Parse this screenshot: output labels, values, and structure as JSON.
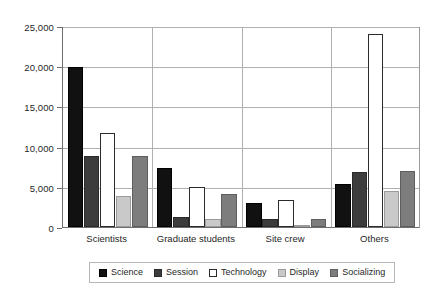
{
  "chart_data": {
    "type": "bar",
    "title": "",
    "subtitle": "",
    "xlabel": "",
    "ylabel": "",
    "ylim": [
      0,
      25000
    ],
    "ytick_values": [
      0,
      5000,
      10000,
      15000,
      20000,
      25000
    ],
    "ytick_labels": [
      "0",
      "5,000",
      "10,000",
      "15,000",
      "20,000",
      "25,000"
    ],
    "grid": "horizontal-and-group-separators",
    "legend_position": "bottom-center",
    "categories": [
      "Scientists",
      "Graduate students",
      "Site crew",
      "Others"
    ],
    "series": [
      {
        "name": "Science",
        "color": "#111111",
        "values": [
          19900,
          7300,
          3000,
          5400
        ]
      },
      {
        "name": "Session",
        "color": "#3c3c3c",
        "values": [
          8800,
          1300,
          1000,
          6800
        ]
      },
      {
        "name": "Technology",
        "color": "#ffffff",
        "values": [
          11700,
          5000,
          3300,
          24000
        ]
      },
      {
        "name": "Display",
        "color": "#c9c9c9",
        "values": [
          3800,
          1000,
          300,
          4500
        ]
      },
      {
        "name": "Socializing",
        "color": "#7d7d7d",
        "values": [
          8800,
          4100,
          1000,
          7000
        ]
      }
    ]
  },
  "legend": {
    "items": [
      {
        "label": "Science"
      },
      {
        "label": "Session"
      },
      {
        "label": "Technology"
      },
      {
        "label": "Display"
      },
      {
        "label": "Socializing"
      }
    ]
  }
}
